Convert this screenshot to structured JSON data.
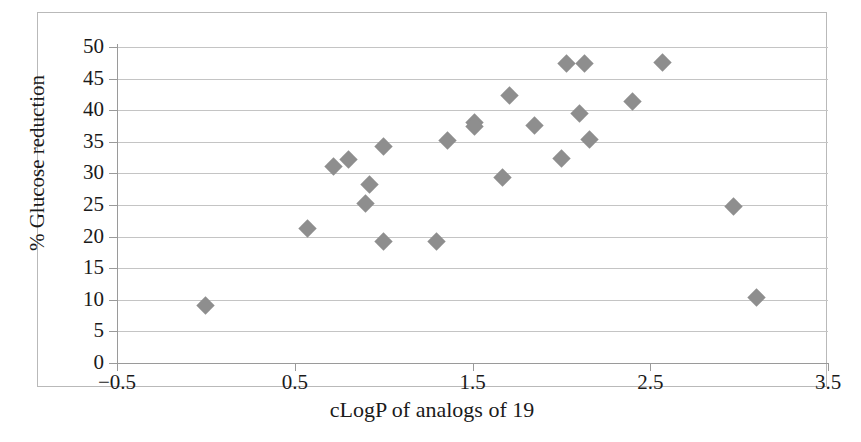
{
  "chart_data": {
    "type": "scatter",
    "title": "",
    "xlabel": "cLogP of analogs of 19",
    "ylabel": "% Glucose reduction",
    "xlim": [
      -0.5,
      3.5
    ],
    "ylim": [
      0,
      50
    ],
    "xticks": [
      "-0.5",
      "0.5",
      "1.5",
      "2.5",
      "3.5"
    ],
    "xtick_values": [
      -0.5,
      0.5,
      1.5,
      2.5,
      3.5
    ],
    "yticks": [
      "0",
      "5",
      "10",
      "15",
      "20",
      "25",
      "30",
      "35",
      "40",
      "45",
      "50"
    ],
    "ytick_values": [
      0,
      5,
      10,
      15,
      20,
      25,
      30,
      35,
      40,
      45,
      50
    ],
    "grid": "horizontal",
    "legend": "none",
    "marker": "diamond",
    "marker_color": "#8e8e8e",
    "points": [
      {
        "x": 0.0,
        "y": 9.1
      },
      {
        "x": 0.57,
        "y": 21.3
      },
      {
        "x": 0.72,
        "y": 31.1
      },
      {
        "x": 0.8,
        "y": 32.2
      },
      {
        "x": 0.9,
        "y": 25.2
      },
      {
        "x": 0.92,
        "y": 28.3
      },
      {
        "x": 1.0,
        "y": 34.2
      },
      {
        "x": 1.0,
        "y": 19.3
      },
      {
        "x": 1.3,
        "y": 19.3
      },
      {
        "x": 1.36,
        "y": 35.2
      },
      {
        "x": 1.51,
        "y": 38.1
      },
      {
        "x": 1.51,
        "y": 37.4
      },
      {
        "x": 1.67,
        "y": 29.4
      },
      {
        "x": 1.71,
        "y": 42.3
      },
      {
        "x": 1.85,
        "y": 37.6
      },
      {
        "x": 2.03,
        "y": 47.4
      },
      {
        "x": 2.13,
        "y": 47.4
      },
      {
        "x": 2.0,
        "y": 32.3
      },
      {
        "x": 2.1,
        "y": 39.5
      },
      {
        "x": 2.16,
        "y": 35.3
      },
      {
        "x": 2.4,
        "y": 41.4
      },
      {
        "x": 2.57,
        "y": 47.5
      },
      {
        "x": 2.97,
        "y": 24.7
      },
      {
        "x": 3.1,
        "y": 10.4
      }
    ]
  }
}
